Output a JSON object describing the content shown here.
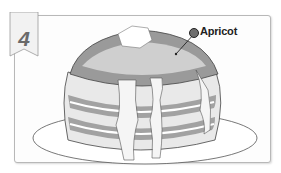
{
  "step": {
    "number": "4"
  },
  "illustration": {
    "subject": "stack of pancakes with butter pat and drizzled topping on a plate",
    "callout": {
      "label": "Apricot",
      "marker_color": "#6e6e6e"
    }
  },
  "colors": {
    "border": "#b8b8b8",
    "ribbon_fill": "#f2f2f2",
    "number": "#6a6a6a",
    "shade_dark": "#7a7a7a",
    "shade_light": "#d9d9d9"
  }
}
